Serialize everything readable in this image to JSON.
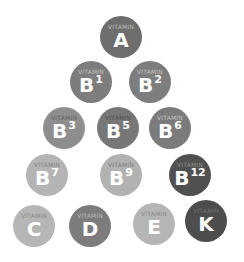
{
  "label_text": "VITAMIN",
  "vitamins": [
    {
      "letter": "A",
      "sup": "",
      "x": 121,
      "y": 37,
      "r": 21,
      "color": "#6e6e6e",
      "label_color": "#c9c9c9"
    },
    {
      "letter": "B",
      "sup": "1",
      "x": 91,
      "y": 82,
      "r": 21,
      "color": "#7d7d7d",
      "label_color": "#cfcfcf"
    },
    {
      "letter": "B",
      "sup": "2",
      "x": 150,
      "y": 82,
      "r": 21,
      "color": "#7d7d7d",
      "label_color": "#cfcfcf"
    },
    {
      "letter": "B",
      "sup": "3",
      "x": 64,
      "y": 128,
      "r": 21,
      "color": "#8e8e8e",
      "label_color": "#5c5c5c"
    },
    {
      "letter": "B",
      "sup": "5",
      "x": 118,
      "y": 128,
      "r": 21,
      "color": "#777777",
      "label_color": "#4a4a4a"
    },
    {
      "letter": "B",
      "sup": "6",
      "x": 170,
      "y": 128,
      "r": 21,
      "color": "#7b7b7b",
      "label_color": "#cfcfcf"
    },
    {
      "letter": "B",
      "sup": "7",
      "x": 47,
      "y": 175,
      "r": 21,
      "color": "#b4b4b4",
      "label_color": "#7a7a7a"
    },
    {
      "letter": "B",
      "sup": "9",
      "x": 121,
      "y": 175,
      "r": 21,
      "color": "#b2b2b2",
      "label_color": "#777777"
    },
    {
      "letter": "B",
      "sup": "12",
      "x": 190,
      "y": 175,
      "r": 21,
      "color": "#505050",
      "label_color": "#9a9a9a"
    },
    {
      "letter": "C",
      "sup": "",
      "x": 34,
      "y": 226,
      "r": 21,
      "color": "#b6b6b6",
      "label_color": "#858585"
    },
    {
      "letter": "D",
      "sup": "",
      "x": 90,
      "y": 226,
      "r": 21,
      "color": "#7c7c7c",
      "label_color": "#c5c5c5"
    },
    {
      "letter": "E",
      "sup": "",
      "x": 154,
      "y": 224,
      "r": 21,
      "color": "#b5b5b5",
      "label_color": "#838383"
    },
    {
      "letter": "K",
      "sup": "",
      "x": 206,
      "y": 221,
      "r": 21,
      "color": "#4d4d4d",
      "label_color": "#757575"
    }
  ]
}
